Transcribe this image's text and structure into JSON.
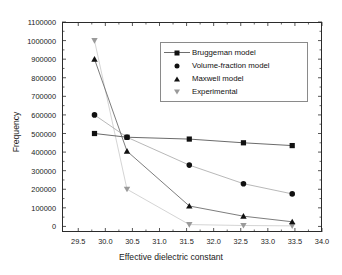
{
  "chart_data": {
    "type": "line",
    "title": "",
    "xlabel": "Effective dielectric constant",
    "ylabel": "Frequency",
    "xlim": [
      29.2,
      34.0
    ],
    "ylim": [
      -30000,
      1100000
    ],
    "xticks": [
      29.5,
      30.0,
      30.5,
      31.0,
      31.5,
      32.0,
      32.5,
      33.0,
      33.5,
      34.0
    ],
    "xtick_labels": [
      "29.5",
      "30.0",
      "30.5",
      "31.0",
      "31.5",
      "32.0",
      "32.5",
      "33.0",
      "33.5",
      "34.0"
    ],
    "yticks": [
      0,
      100000,
      200000,
      300000,
      400000,
      500000,
      600000,
      700000,
      800000,
      900000,
      1000000,
      1100000
    ],
    "ytick_labels": [
      "0",
      "100000",
      "200000",
      "300000",
      "400000",
      "500000",
      "600000",
      "700000",
      "800000",
      "900000",
      "1000000",
      "1100000"
    ],
    "grid": false,
    "legend_position": "upper-center-right",
    "x": [
      29.8,
      30.4,
      31.55,
      32.55,
      33.45
    ],
    "series": [
      {
        "name": "Bruggeman model",
        "marker": "square",
        "color": "#111111",
        "line_color": "#5a5a5a",
        "values": [
          500000,
          480000,
          470000,
          450000,
          435000
        ]
      },
      {
        "name": "Volume-fraction model",
        "marker": "circle",
        "color": "#111111",
        "line_color": "#b0b0b0",
        "values": [
          600000,
          480000,
          330000,
          230000,
          175000
        ]
      },
      {
        "name": "Maxwell model",
        "marker": "triangle-up",
        "color": "#111111",
        "line_color": "#6e6e6e",
        "values": [
          900000,
          405000,
          110000,
          55000,
          25000
        ]
      },
      {
        "name": "Experimental",
        "marker": "triangle-down",
        "color": "#9a9a9a",
        "line_color": "#cfcfcf",
        "values": [
          1000000,
          200000,
          10000,
          5000,
          3000
        ]
      }
    ]
  },
  "legend": {
    "entries": [
      {
        "label": "Bruggeman model"
      },
      {
        "label": "Volume-fraction model"
      },
      {
        "label": "Maxwell model"
      },
      {
        "label": "Experimental"
      }
    ]
  }
}
